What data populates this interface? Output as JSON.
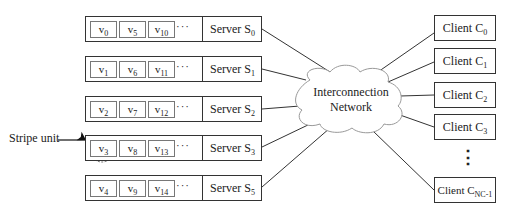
{
  "servers": [
    {
      "label": "Server S",
      "sub": "0",
      "units": [
        {
          "v": "v",
          "s": "0"
        },
        {
          "v": "v",
          "s": "5"
        },
        {
          "v": "v",
          "s": "10"
        }
      ]
    },
    {
      "label": "Server S",
      "sub": "1",
      "units": [
        {
          "v": "v",
          "s": "1"
        },
        {
          "v": "v",
          "s": "6"
        },
        {
          "v": "v",
          "s": "11"
        }
      ]
    },
    {
      "label": "Server S",
      "sub": "2",
      "units": [
        {
          "v": "v",
          "s": "2"
        },
        {
          "v": "v",
          "s": "7"
        },
        {
          "v": "v",
          "s": "12"
        }
      ]
    },
    {
      "label": "Server S",
      "sub": "3",
      "units": [
        {
          "v": "v",
          "s": "3"
        },
        {
          "v": "v",
          "s": "8"
        },
        {
          "v": "v",
          "s": "13"
        }
      ]
    },
    {
      "label": "Server S",
      "sub": "5",
      "units": [
        {
          "v": "v",
          "s": "4"
        },
        {
          "v": "v",
          "s": "9"
        },
        {
          "v": "v",
          "s": "14"
        }
      ]
    }
  ],
  "ellipsis": "···",
  "network": {
    "line1": "Interconnection",
    "line2": "Network"
  },
  "clients": [
    {
      "label": "Client C",
      "sub": "0"
    },
    {
      "label": "Client C",
      "sub": "1"
    },
    {
      "label": "Client C",
      "sub": "2"
    },
    {
      "label": "Client C",
      "sub": "3"
    },
    {
      "label": "Client C",
      "sub": "NC-1"
    }
  ],
  "client_ellipsis": "⋮",
  "stripe_label": "Stripe unit"
}
